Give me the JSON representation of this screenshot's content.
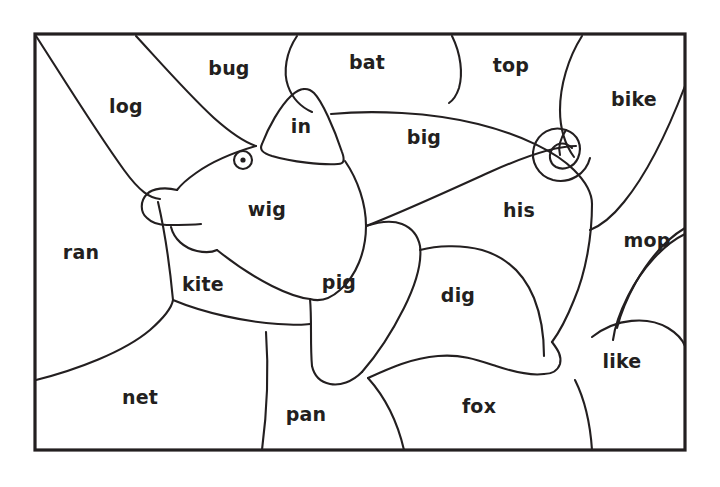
{
  "worksheet": {
    "type": "color-by-word-picture",
    "subject": "pig",
    "background_color": "#ffffff",
    "ink_color": "#231f20",
    "frame": {
      "x": 35,
      "y": 34,
      "width": 650,
      "height": 416
    },
    "word_count": 17,
    "words": [
      {
        "text": "bug",
        "x": 229,
        "y": 68
      },
      {
        "text": "bat",
        "x": 367,
        "y": 62
      },
      {
        "text": "top",
        "x": 511,
        "y": 65
      },
      {
        "text": "log",
        "x": 126,
        "y": 106
      },
      {
        "text": "bike",
        "x": 634,
        "y": 99
      },
      {
        "text": "in",
        "x": 301,
        "y": 126
      },
      {
        "text": "big",
        "x": 424,
        "y": 137
      },
      {
        "text": "his",
        "x": 519,
        "y": 210
      },
      {
        "text": "wig",
        "x": 267,
        "y": 209
      },
      {
        "text": "ran",
        "x": 81,
        "y": 252
      },
      {
        "text": "mop",
        "x": 647,
        "y": 240
      },
      {
        "text": "kite",
        "x": 203,
        "y": 284
      },
      {
        "text": "pig",
        "x": 339,
        "y": 282
      },
      {
        "text": "dig",
        "x": 458,
        "y": 295
      },
      {
        "text": "like",
        "x": 622,
        "y": 361
      },
      {
        "text": "net",
        "x": 140,
        "y": 397
      },
      {
        "text": "pan",
        "x": 306,
        "y": 414
      },
      {
        "text": "fox",
        "x": 479,
        "y": 406
      }
    ],
    "shapes": {
      "frame_label": "worksheet-border",
      "pig_features": [
        "ear",
        "eye",
        "snout",
        "mouth",
        "curly-tail",
        "front-leg",
        "hind-leg",
        "belly"
      ]
    }
  }
}
